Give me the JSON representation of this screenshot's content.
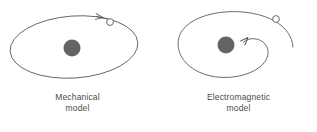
{
  "figure": {
    "width": 317,
    "height": 132,
    "background": "#ffffff",
    "stroke_color": "#5a5a5a",
    "nucleus_color": "#646464",
    "text_color": "#4c4c4c"
  },
  "panels": [
    {
      "id": "mechanical",
      "caption_line1": "Mechanical",
      "caption_line2": "model",
      "orbit_type": "closed-ellipse",
      "nucleus": {
        "cx": 72,
        "cy": 48,
        "r": 8.5,
        "label": "nucleus"
      },
      "electron": {
        "cx": 110,
        "cy": 22,
        "r": 3.4,
        "label": "electron",
        "fill": "#ffffff"
      },
      "direction_arrow": {
        "label": "counterclockwise-direction-arrow",
        "points_toward": "left"
      }
    },
    {
      "id": "electromagnetic",
      "caption_line1": "Electromagnetic",
      "caption_line2": "model",
      "orbit_type": "inward-spiral",
      "nucleus": {
        "cx": 226,
        "cy": 45,
        "r": 8.5,
        "label": "nucleus"
      },
      "electron": {
        "cx": 276,
        "cy": 19,
        "r": 3.4,
        "label": "electron",
        "fill": "#ffffff"
      },
      "direction_arrow": {
        "label": "inward-spiral-arrow",
        "points_toward": "left"
      }
    }
  ]
}
